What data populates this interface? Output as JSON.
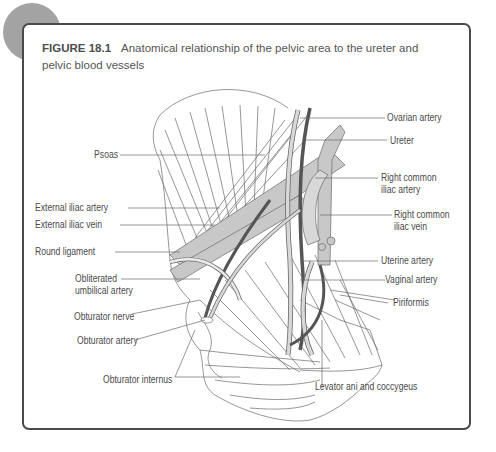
{
  "figure": {
    "number": "FIGURE 18.1",
    "caption": "Anatomical relationship of the pelvic area to the ureter and pelvic blood vessels"
  },
  "labels": {
    "left": {
      "psoas": "Psoas",
      "external_iliac_artery": "External iliac artery",
      "external_iliac_vein": "External iliac vein",
      "round_ligament": "Round ligament",
      "obliterated_umbilical_artery_line1": "Obliterated",
      "obliterated_umbilical_artery_line2": "umbilical artery",
      "obturator_nerve": "Obturator nerve",
      "obturator_artery": "Obturator artery",
      "obturator_internus": "Obturator internus"
    },
    "right": {
      "ovarian_artery": "Ovarian artery",
      "ureter": "Ureter",
      "right_common_iliac_artery_line1": "Right common",
      "right_common_iliac_artery_line2": "iliac artery",
      "right_common_iliac_vein_line1": "Right common",
      "right_common_iliac_vein_line2": "iliac vein",
      "uterine_artery": "Uterine artery",
      "vaginal_artery": "Vaginal artery",
      "piriformis": "Piriformis",
      "levator_ani_and_coccygeus": "Levator ani and coccygeus"
    }
  },
  "colors": {
    "frame": "#4a4a4a",
    "badge": "#a3a3a3",
    "vessel_fill": "#c8c8c8",
    "dark_vessel": "#555555",
    "line": "#6a6a6a"
  }
}
